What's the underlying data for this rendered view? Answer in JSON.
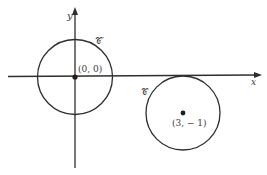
{
  "diagram": {
    "axes": {
      "x_label": "x",
      "y_label": "y"
    },
    "circles": [
      {
        "name": "C'",
        "label": "𝒞′",
        "center_label": "(0, 0)",
        "center": [
          0,
          0
        ]
      },
      {
        "name": "C",
        "label": "𝒞",
        "center_label": "(3, − 1)",
        "center": [
          3,
          -1
        ]
      }
    ],
    "colors": {
      "stroke": "#2e2e2e",
      "background": "#ffffff"
    }
  }
}
